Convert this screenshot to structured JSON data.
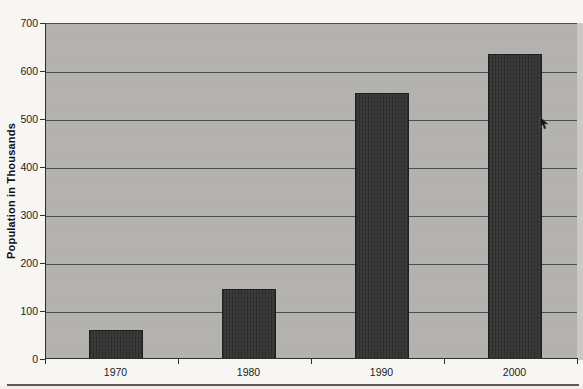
{
  "chart_data": {
    "type": "bar",
    "categories": [
      "1970",
      "1980",
      "1990",
      "2000"
    ],
    "values": [
      60,
      145,
      555,
      635
    ],
    "title": "",
    "xlabel": "",
    "ylabel": "Population in Thousands",
    "ylim": [
      0,
      700
    ],
    "ytick_interval": 100,
    "yticks": [
      0,
      100,
      200,
      300,
      400,
      500,
      600,
      700
    ],
    "grid": true,
    "legend": false,
    "plot_background": "#b2b1ae",
    "bar_color": "#3b3b3b",
    "gridline_color": "#4c4c4c",
    "axis_color": "#2e2e2e",
    "outer_background": "#f7f6f2",
    "text_color": "#1c1c1c"
  },
  "cursor": {
    "visible": true,
    "note": "mouse-cursor-arrow-over-2000-bar"
  }
}
